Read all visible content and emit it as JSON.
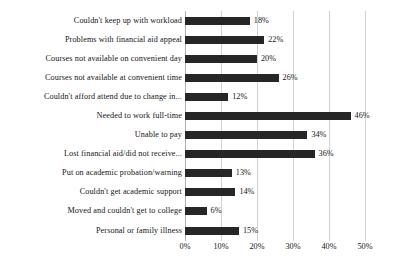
{
  "chart_data": {
    "type": "bar",
    "orientation": "horizontal",
    "title": "",
    "subtitle": "",
    "xlabel": "",
    "ylabel": "",
    "xlim": [
      0,
      50
    ],
    "xticks": [
      "0%",
      "10%",
      "20%",
      "30%",
      "40%",
      "50%"
    ],
    "xtick_values": [
      0,
      10,
      20,
      30,
      40,
      50
    ],
    "grid": true,
    "legend": false,
    "legend_position": "none",
    "bar_color": "#262626",
    "gridline_color": "#d2d2d2",
    "axis_color": "#b0b0b0",
    "categories": [
      "Couldn't keep up with workload",
      "Problems with financial aid appeal",
      "Courses not available on convenient day",
      "Courses not available at convenient time",
      "Couldn't afford attend due to change in...",
      "Needed to work full-time",
      "Unable to pay",
      "Lost financial aid/did not receive...",
      "Put on academic probation/warning",
      "Couldn't get academic support",
      "Moved and couldn't get to college",
      "Personal or family illness"
    ],
    "values": [
      18,
      22,
      20,
      26,
      12,
      46,
      34,
      36,
      13,
      14,
      6,
      15
    ],
    "value_labels": [
      "18%",
      "22%",
      "20%",
      "26%",
      "12%",
      "46%",
      "34%",
      "36%",
      "13%",
      "14%",
      "6%",
      "15%"
    ]
  }
}
